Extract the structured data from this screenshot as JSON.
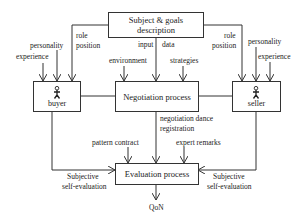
{
  "diagram": {
    "type": "flowchart",
    "nodes": {
      "subject": {
        "label_line1": "Subject & goals",
        "label_line2": "description"
      },
      "negotiation": {
        "label": "Negotiation process"
      },
      "evaluation": {
        "label": "Evaluation process"
      },
      "buyer": {
        "label": "buyer",
        "icon": "person-icon"
      },
      "seller": {
        "label": "seller",
        "icon": "person-icon"
      }
    },
    "labels": {
      "buyer_role_1": "role",
      "buyer_role_2": "position",
      "buyer_personality": "personality",
      "buyer_experience": "experience",
      "seller_role_1": "role",
      "seller_role_2": "position",
      "seller_personality": "personality",
      "seller_experience": "experience",
      "input": "input",
      "data": "data",
      "environment": "environment",
      "strategies": "strategies",
      "negotiation_dance_1": "negotiation dance",
      "negotiation_dance_2": "registration",
      "pattern_contract": "pattern contract",
      "expert_remarks": "expert remarks",
      "buyer_subjective_1": "Subjective",
      "buyer_subjective_2": "self-evaluation",
      "seller_subjective_1": "Subjective",
      "seller_subjective_2": "self-evaluation",
      "output": "QoN"
    },
    "colors": {
      "line": "#333333",
      "background": "#ffffff",
      "text": "#222222"
    }
  }
}
